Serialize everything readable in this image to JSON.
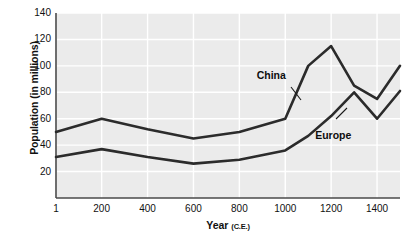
{
  "chart_data": {
    "type": "line",
    "title": "",
    "xlabel": "Year",
    "xlabel_sub": "(C.E.)",
    "ylabel": "Population (in millions)",
    "xlim": [
      1,
      1500
    ],
    "ylim": [
      0,
      140
    ],
    "grid": true,
    "legend": "inline-labels",
    "x_ticks": [
      1,
      200,
      400,
      600,
      800,
      1000,
      1200,
      1400
    ],
    "x_tick_labels": [
      "1",
      "200",
      "400",
      "600",
      "800",
      "1000",
      "1200",
      "1400"
    ],
    "y_ticks": [
      20,
      40,
      60,
      80,
      100,
      120,
      140
    ],
    "y_tick_labels": [
      "20",
      "40",
      "60",
      "80",
      "100",
      "120",
      "140"
    ],
    "x": [
      1,
      200,
      400,
      600,
      800,
      1000,
      1100,
      1200,
      1300,
      1400,
      1500
    ],
    "series": [
      {
        "name": "China",
        "color": "#2b2b2b",
        "values": [
          50,
          60,
          52,
          45,
          50,
          60,
          100,
          115,
          85,
          75,
          100
        ],
        "label_x": 1015,
        "label_y": 92
      },
      {
        "name": "Europe",
        "color": "#2b2b2b",
        "values": [
          31,
          37,
          31,
          26,
          29,
          36,
          47,
          62,
          80,
          60,
          81
        ],
        "label_x": 1270,
        "label_y": 47
      }
    ]
  },
  "figure": {
    "caption_remnant": ""
  }
}
